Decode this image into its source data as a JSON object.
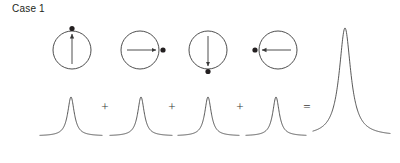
{
  "figure": {
    "title": "Case 1",
    "width": 400,
    "height": 163,
    "background": "#ffffff",
    "stroke_color": "#3a3a3a",
    "text_color": "#231f20"
  },
  "diagram_data": {
    "type": "diagram",
    "description": "Four circles each with an arrow and a dot marker at four cardinal orientations, each contributing a lineshape peak; the four peaks sum to one tall peak.",
    "circles": [
      {
        "index": 1,
        "cx": 72,
        "cy": 50,
        "r": 19,
        "arrow_direction": "up",
        "arrow_symbol": "↑",
        "dot_position": "top",
        "dot_cx": 72,
        "dot_cy": 28
      },
      {
        "index": 2,
        "cx": 140,
        "cy": 50,
        "r": 19,
        "arrow_direction": "right",
        "arrow_symbol": "→",
        "dot_position": "right",
        "dot_cx": 163,
        "dot_cy": 50
      },
      {
        "index": 3,
        "cx": 208,
        "cy": 50,
        "r": 19,
        "arrow_direction": "down",
        "arrow_symbol": "↓",
        "dot_position": "bottom",
        "dot_cx": 208,
        "dot_cy": 72
      },
      {
        "index": 4,
        "cx": 278,
        "cy": 50,
        "r": 19,
        "arrow_direction": "left",
        "arrow_symbol": "←",
        "dot_position": "left",
        "dot_cx": 255,
        "dot_cy": 50
      }
    ],
    "peaks": [
      {
        "index": 1,
        "center_x": 71,
        "baseline_y": 136,
        "apex_y": 97,
        "amplitude": 39,
        "half_width": 4,
        "span": [
          40,
          102
        ],
        "role": "component"
      },
      {
        "index": 2,
        "center_x": 141,
        "baseline_y": 136,
        "apex_y": 97,
        "amplitude": 39,
        "half_width": 4,
        "span": [
          110,
          172
        ],
        "role": "component"
      },
      {
        "index": 3,
        "center_x": 208,
        "baseline_y": 136,
        "apex_y": 97,
        "amplitude": 39,
        "half_width": 4,
        "span": [
          178,
          239
        ],
        "role": "component"
      },
      {
        "index": 4,
        "center_x": 276,
        "baseline_y": 136,
        "apex_y": 97,
        "amplitude": 39,
        "half_width": 4,
        "span": [
          246,
          306
        ],
        "role": "component"
      },
      {
        "index": 5,
        "center_x": 345,
        "baseline_y": 136,
        "apex_y": 28,
        "amplitude": 108,
        "half_width": 7,
        "span": [
          313,
          390
        ],
        "role": "sum"
      }
    ],
    "operators": [
      {
        "symbol": "+",
        "x": 105,
        "y": 111
      },
      {
        "symbol": "+",
        "x": 172,
        "y": 111
      },
      {
        "symbol": "+",
        "x": 240,
        "y": 111
      },
      {
        "symbol": "=",
        "x": 307,
        "y": 111
      }
    ]
  }
}
